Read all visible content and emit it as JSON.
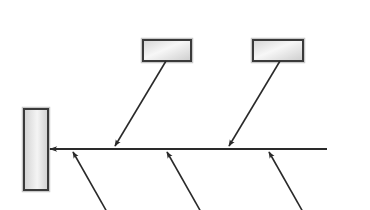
{
  "diagram": {
    "type": "fishbone",
    "title": "",
    "colors": {
      "background": "#ffffff",
      "line": "#2a2a2a",
      "box_border": "#3a3a3a",
      "box_outer": "#c8c8c8",
      "box_fill_light": "#f6f6f6",
      "box_fill_dark": "#cfcfcf"
    },
    "effect_box": {
      "label": "",
      "x": 24,
      "y": 109,
      "width": 24,
      "height": 81
    },
    "spine": {
      "x1": 327,
      "y1": 149,
      "x2": 50,
      "y2": 149,
      "arrowhead": "left"
    },
    "cause_boxes": [
      {
        "id": "cause-top-1",
        "label": "",
        "x": 143,
        "y": 40,
        "width": 48,
        "height": 21
      },
      {
        "id": "cause-top-2",
        "label": "",
        "x": 253,
        "y": 40,
        "width": 50,
        "height": 21
      }
    ],
    "branches_top": [
      {
        "id": "branch-top-1",
        "x1": 166,
        "y1": 61,
        "x2": 115,
        "y2": 146
      },
      {
        "id": "branch-top-2",
        "x1": 280,
        "y1": 61,
        "x2": 229,
        "y2": 146
      }
    ],
    "branches_bottom": [
      {
        "id": "branch-bottom-1",
        "x1": 107,
        "y1": 212,
        "x2": 73,
        "y2": 152
      },
      {
        "id": "branch-bottom-2",
        "x1": 201,
        "y1": 212,
        "x2": 167,
        "y2": 152
      },
      {
        "id": "branch-bottom-3",
        "x1": 303,
        "y1": 212,
        "x2": 269,
        "y2": 152
      }
    ]
  }
}
